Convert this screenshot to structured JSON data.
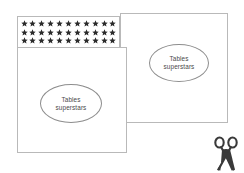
{
  "canvas": {
    "width": 244,
    "height": 173,
    "background_color": "#ffffff"
  },
  "theme": {
    "card_border_color": "#b9b9b9",
    "oval_border_color": "#8d8d8d",
    "text_color": "#4a4a4a",
    "star_color": "#2b2b2b",
    "scissors_color": "#3a3a3a"
  },
  "cards": {
    "back_card": {
      "label": "tables-superstars-card-back",
      "oval": {
        "line1": "Tables",
        "line2": "superstars"
      }
    },
    "front_card": {
      "label": "tables-superstars-card-front",
      "oval": {
        "line1": "Tables",
        "line2": "superstars"
      }
    }
  },
  "star_banner": {
    "label": "star-banner",
    "icon": "star-icon",
    "rows": 3,
    "stars_per_row": 11,
    "total_stars": 33
  },
  "scissors": {
    "label": "cut-here-scissors",
    "icon": "scissors-icon"
  }
}
